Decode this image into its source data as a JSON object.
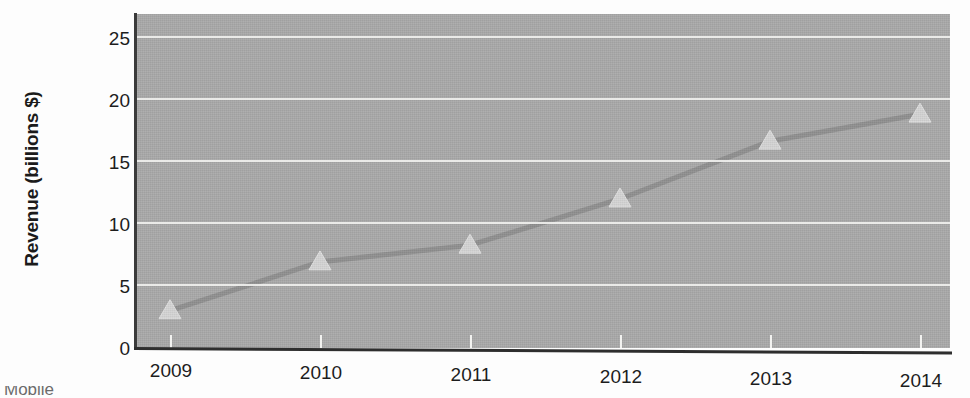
{
  "chart_data": {
    "type": "line",
    "title": "",
    "xlabel": "",
    "ylabel": "Revenue (billions $)",
    "categories": [
      "2009",
      "2010",
      "2011",
      "2012",
      "2013",
      "2014"
    ],
    "values": [
      2.9,
      6.7,
      8.0,
      11.6,
      16.1,
      18.2
    ],
    "series": [
      {
        "name": "Revenue",
        "values": [
          2.9,
          6.7,
          8.0,
          11.6,
          16.1,
          18.2
        ],
        "marker": "triangle",
        "line_color": "#8d8d8d",
        "marker_color": "#d8d8d8"
      }
    ],
    "ylim": [
      0,
      26
    ],
    "yticks": [
      "0",
      "5",
      "10",
      "15",
      "20",
      "25"
    ],
    "ytick_values": [
      0,
      5,
      10,
      15,
      20,
      25
    ],
    "xticks": [
      "2009",
      "2010",
      "2011",
      "2012",
      "2013",
      "2014"
    ],
    "grid": true,
    "grid_axis": "y",
    "grid_color": "#f0f0ee",
    "legend": false,
    "legend_position": "none",
    "plot_background": "#a9a9a9",
    "figure_background": "#fdfdfd"
  },
  "axes": {
    "y_title": "Revenue (billions $)",
    "y_tick_labels": [
      "25",
      "20",
      "15",
      "10",
      "5",
      "0"
    ],
    "x_tick_labels": [
      "2009",
      "2010",
      "2011",
      "2012",
      "2013",
      "2014"
    ]
  },
  "caption": {
    "text": "Mobile"
  }
}
